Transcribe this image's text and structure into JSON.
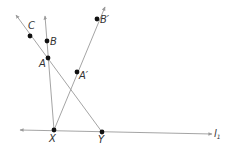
{
  "diagram": {
    "background": "#ffffff",
    "line_color": "#9a9a9a",
    "point_color": "#111111",
    "label_color": "#333333",
    "points": {
      "C": {
        "label": "C",
        "x": 30,
        "y": 36
      },
      "B": {
        "label": "B",
        "x": 47,
        "y": 41
      },
      "A": {
        "label": "A",
        "x": 48,
        "y": 58
      },
      "A_prime": {
        "label": "A′",
        "x": 77,
        "y": 72
      },
      "B_prime": {
        "label": "B′",
        "x": 97,
        "y": 19
      },
      "X": {
        "label": "X",
        "x": 54,
        "y": 130
      },
      "Y": {
        "label": "Y",
        "x": 102,
        "y": 132
      }
    },
    "lines": {
      "l1": {
        "label": "l",
        "subscript": "1"
      }
    }
  }
}
